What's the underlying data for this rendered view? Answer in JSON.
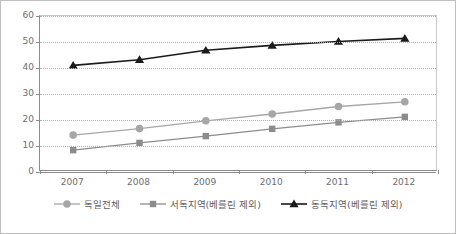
{
  "chart_data": {
    "type": "line",
    "title": "",
    "subtitle": "",
    "xlabel": "",
    "ylabel": "",
    "categories": [
      "2007",
      "2008",
      "2009",
      "2010",
      "2011",
      "2012"
    ],
    "ylim": [
      0,
      60
    ],
    "yticks": [
      0,
      10,
      20,
      30,
      40,
      50,
      60
    ],
    "ytick_labels": [
      "0",
      "10",
      "20",
      "30",
      "40",
      "50",
      "60"
    ],
    "grid": true,
    "grid_style": "dotted-horizontal",
    "legend_position": "bottom",
    "series": [
      {
        "name": "독일전체",
        "marker": "circle",
        "color": "#a6a6a6",
        "values": [
          14.2,
          16.7,
          19.7,
          22.3,
          25.2,
          27.0
        ]
      },
      {
        "name": "서독지역(베를린 제외)",
        "marker": "square",
        "color": "#8c8c8c",
        "values": [
          8.4,
          11.2,
          13.8,
          16.6,
          19.1,
          21.2
        ]
      },
      {
        "name": "동독지역(베를린 제외)",
        "marker": "triangle",
        "color": "#1a1a1a",
        "values": [
          41.0,
          43.2,
          46.8,
          48.7,
          50.2,
          51.4
        ]
      }
    ]
  },
  "axis": {
    "y_labels": [
      "60",
      "50",
      "40",
      "30",
      "20",
      "10",
      "0"
    ],
    "x_labels": [
      "2007",
      "2008",
      "2009",
      "2010",
      "2011",
      "2012"
    ]
  },
  "legend": {
    "items": [
      {
        "label": "독일전체",
        "marker": "circle-marker",
        "color": "#a6a6a6"
      },
      {
        "label": "서독지역(베를린 제외)",
        "marker": "square-marker",
        "color": "#8c8c8c"
      },
      {
        "label": "동독지역(베를린 제외)",
        "marker": "triangle-marker",
        "color": "#1a1a1a"
      }
    ]
  },
  "colors": {
    "frame": "#bfbfbf",
    "axis": "#8c8c8c",
    "grid": "#b0b0b0",
    "tick_text": "#6e6e6e",
    "legend_text": "#5f5f5f"
  }
}
